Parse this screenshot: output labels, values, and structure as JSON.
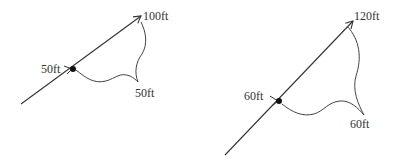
{
  "diagrams": [
    {
      "id": "left",
      "start_label": "50ft",
      "end_label": "100ft",
      "curve_label": "50ft"
    },
    {
      "id": "right",
      "start_label": "60ft",
      "end_label": "120ft",
      "curve_label": "60ft"
    }
  ],
  "colors": {
    "line": "#333333",
    "dot": "#111111"
  }
}
